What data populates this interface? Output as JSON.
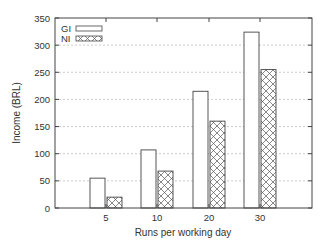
{
  "chart_data": {
    "type": "bar",
    "title": "",
    "xlabel": "Runs per working day",
    "ylabel": "Income (BRL)",
    "categories": [
      "5",
      "10",
      "20",
      "30"
    ],
    "series": [
      {
        "name": "GI",
        "values": [
          55,
          107,
          215,
          324
        ],
        "fill": "#ffffff",
        "pattern": "none"
      },
      {
        "name": "NI",
        "values": [
          20,
          68,
          160,
          255
        ],
        "fill": "#ffffff",
        "pattern": "crosshatch"
      }
    ],
    "ylim": [
      0,
      350
    ],
    "yticks": [
      0,
      50,
      100,
      150,
      200,
      250,
      300,
      350
    ],
    "grid": true,
    "legend_position": "top-left"
  }
}
